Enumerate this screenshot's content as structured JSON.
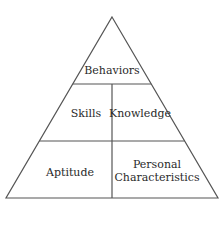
{
  "diagram": {
    "type": "pyramid",
    "line_color": "#555555",
    "text_color": "#2a2a2a",
    "tiers": [
      {
        "level": 1,
        "sections": [
          {
            "label": "Behaviors"
          }
        ]
      },
      {
        "level": 2,
        "sections": [
          {
            "label": "Skills"
          },
          {
            "label": "Knowledge"
          }
        ]
      },
      {
        "level": 3,
        "sections": [
          {
            "label": "Aptitude"
          },
          {
            "label": "Personal Characteristics"
          }
        ]
      }
    ],
    "labels": {
      "behaviors": "Behaviors",
      "skills": "Skills",
      "knowledge": "Knowledge",
      "aptitude": "Aptitude",
      "personal_line1": "Personal",
      "personal_line2": "Characteristics"
    }
  }
}
